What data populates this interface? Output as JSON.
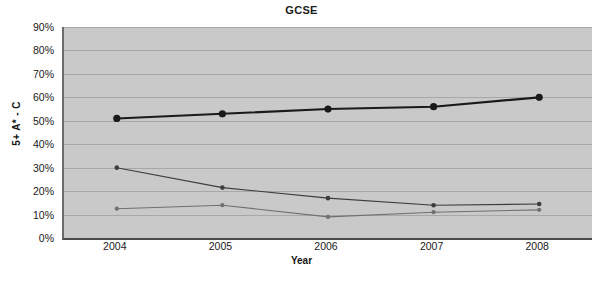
{
  "chart_data": {
    "type": "line",
    "title": "GCSE",
    "xlabel": "Year",
    "ylabel": "5+ A* - C",
    "categories": [
      "2004",
      "2005",
      "2006",
      "2007",
      "2008"
    ],
    "x": [
      2004,
      2005,
      2006,
      2007,
      2008
    ],
    "ylim": [
      0,
      90
    ],
    "ytick_labels": [
      "0%",
      "10%",
      "20%",
      "30%",
      "40%",
      "50%",
      "60%",
      "70%",
      "80%",
      "90%"
    ],
    "ytick_values": [
      0,
      10,
      20,
      30,
      40,
      50,
      60,
      70,
      80,
      90
    ],
    "grid": true,
    "legend": "none",
    "plot_background": "#c9c9c9",
    "series": [
      {
        "name": "series-1",
        "values": [
          51,
          53,
          55,
          56,
          60
        ],
        "color": "#1a1a1a",
        "width": 2.1,
        "marker_size": 3.6
      },
      {
        "name": "series-2",
        "values": [
          30,
          21.5,
          17,
          14,
          14.5
        ],
        "color": "#3d3d3d",
        "width": 1.1,
        "marker_size": 2.3
      },
      {
        "name": "series-3",
        "values": [
          12.5,
          14,
          9,
          11,
          12
        ],
        "color": "#707070",
        "width": 1.1,
        "marker_size": 2.1
      }
    ]
  }
}
